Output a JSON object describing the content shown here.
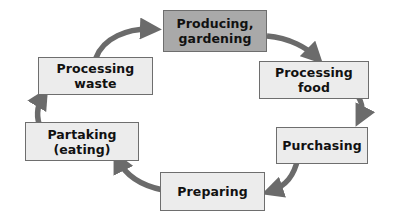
{
  "diagram": {
    "type": "cycle",
    "title": "",
    "colors": {
      "arrow": "#6b6b6b",
      "node_fill": "#ececec",
      "node_fill_highlight": "#a9a9a9",
      "node_border": "#6e6e6e",
      "text": "#111111"
    },
    "nodes": [
      {
        "id": "producing",
        "label": "Producing,\ngardening",
        "highlight": true
      },
      {
        "id": "processing_food",
        "label": "Processing\nfood",
        "highlight": false
      },
      {
        "id": "purchasing",
        "label": "Purchasing",
        "highlight": false
      },
      {
        "id": "preparing",
        "label": "Preparing",
        "highlight": false
      },
      {
        "id": "partaking",
        "label": "Partaking\n(eating)",
        "highlight": false
      },
      {
        "id": "processing_waste",
        "label": "Processing\nwaste",
        "highlight": false
      }
    ],
    "edges": [
      {
        "from": "producing",
        "to": "processing_food"
      },
      {
        "from": "processing_food",
        "to": "purchasing"
      },
      {
        "from": "purchasing",
        "to": "preparing"
      },
      {
        "from": "preparing",
        "to": "partaking"
      },
      {
        "from": "partaking",
        "to": "processing_waste"
      },
      {
        "from": "processing_waste",
        "to": "producing"
      }
    ]
  }
}
